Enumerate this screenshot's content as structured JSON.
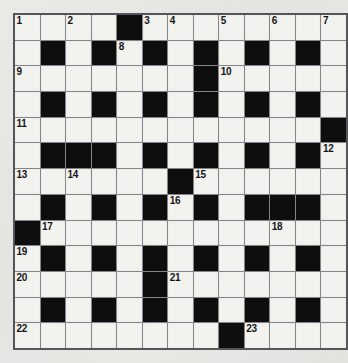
{
  "puzzle": {
    "title": "Crossword Grid",
    "rows": 13,
    "columns": 13,
    "colors": {
      "page_background": "#e9e9e7",
      "white_cell": "#f2f2ef",
      "black_cell": "#0e0e0e",
      "grid_line": "#84848a",
      "grid_border": "#55555a",
      "number_text": "#16161a"
    },
    "clue_numbers": [
      1,
      2,
      3,
      4,
      5,
      6,
      7,
      8,
      9,
      10,
      11,
      12,
      13,
      14,
      15,
      16,
      17,
      18,
      19,
      20,
      21,
      22,
      23
    ],
    "cells": [
      [
        {
          "type": "white",
          "number": "1",
          "letter": ""
        },
        {
          "type": "white",
          "number": "",
          "letter": ""
        },
        {
          "type": "white",
          "number": "2",
          "letter": ""
        },
        {
          "type": "white",
          "number": "",
          "letter": ""
        },
        {
          "type": "black",
          "number": "",
          "letter": ""
        },
        {
          "type": "white",
          "number": "3",
          "letter": ""
        },
        {
          "type": "white",
          "number": "4",
          "letter": ""
        },
        {
          "type": "white",
          "number": "",
          "letter": ""
        },
        {
          "type": "white",
          "number": "5",
          "letter": ""
        },
        {
          "type": "white",
          "number": "",
          "letter": ""
        },
        {
          "type": "white",
          "number": "6",
          "letter": ""
        },
        {
          "type": "white",
          "number": "",
          "letter": ""
        },
        {
          "type": "white",
          "number": "7",
          "letter": ""
        }
      ],
      [
        {
          "type": "white",
          "number": "",
          "letter": ""
        },
        {
          "type": "black",
          "number": "",
          "letter": ""
        },
        {
          "type": "white",
          "number": "",
          "letter": ""
        },
        {
          "type": "black",
          "number": "",
          "letter": ""
        },
        {
          "type": "white",
          "number": "8",
          "letter": ""
        },
        {
          "type": "black",
          "number": "",
          "letter": ""
        },
        {
          "type": "white",
          "number": "",
          "letter": ""
        },
        {
          "type": "black",
          "number": "",
          "letter": ""
        },
        {
          "type": "white",
          "number": "",
          "letter": ""
        },
        {
          "type": "black",
          "number": "",
          "letter": ""
        },
        {
          "type": "white",
          "number": "",
          "letter": ""
        },
        {
          "type": "black",
          "number": "",
          "letter": ""
        },
        {
          "type": "white",
          "number": "",
          "letter": ""
        }
      ],
      [
        {
          "type": "white",
          "number": "9",
          "letter": ""
        },
        {
          "type": "white",
          "number": "",
          "letter": ""
        },
        {
          "type": "white",
          "number": "",
          "letter": ""
        },
        {
          "type": "white",
          "number": "",
          "letter": ""
        },
        {
          "type": "white",
          "number": "",
          "letter": ""
        },
        {
          "type": "white",
          "number": "",
          "letter": ""
        },
        {
          "type": "white",
          "number": "",
          "letter": ""
        },
        {
          "type": "black",
          "number": "",
          "letter": ""
        },
        {
          "type": "white",
          "number": "10",
          "letter": ""
        },
        {
          "type": "white",
          "number": "",
          "letter": ""
        },
        {
          "type": "white",
          "number": "",
          "letter": ""
        },
        {
          "type": "white",
          "number": "",
          "letter": ""
        },
        {
          "type": "white",
          "number": "",
          "letter": ""
        }
      ],
      [
        {
          "type": "white",
          "number": "",
          "letter": ""
        },
        {
          "type": "black",
          "number": "",
          "letter": ""
        },
        {
          "type": "white",
          "number": "",
          "letter": ""
        },
        {
          "type": "black",
          "number": "",
          "letter": ""
        },
        {
          "type": "white",
          "number": "",
          "letter": ""
        },
        {
          "type": "black",
          "number": "",
          "letter": ""
        },
        {
          "type": "white",
          "number": "",
          "letter": ""
        },
        {
          "type": "black",
          "number": "",
          "letter": ""
        },
        {
          "type": "white",
          "number": "",
          "letter": ""
        },
        {
          "type": "black",
          "number": "",
          "letter": ""
        },
        {
          "type": "white",
          "number": "",
          "letter": ""
        },
        {
          "type": "black",
          "number": "",
          "letter": ""
        },
        {
          "type": "white",
          "number": "",
          "letter": ""
        }
      ],
      [
        {
          "type": "white",
          "number": "11",
          "letter": ""
        },
        {
          "type": "white",
          "number": "",
          "letter": ""
        },
        {
          "type": "white",
          "number": "",
          "letter": ""
        },
        {
          "type": "white",
          "number": "",
          "letter": ""
        },
        {
          "type": "white",
          "number": "",
          "letter": ""
        },
        {
          "type": "white",
          "number": "",
          "letter": ""
        },
        {
          "type": "white",
          "number": "",
          "letter": ""
        },
        {
          "type": "white",
          "number": "",
          "letter": ""
        },
        {
          "type": "white",
          "number": "",
          "letter": ""
        },
        {
          "type": "white",
          "number": "",
          "letter": ""
        },
        {
          "type": "white",
          "number": "",
          "letter": ""
        },
        {
          "type": "white",
          "number": "",
          "letter": ""
        },
        {
          "type": "black",
          "number": "",
          "letter": ""
        }
      ],
      [
        {
          "type": "white",
          "number": "",
          "letter": ""
        },
        {
          "type": "black",
          "number": "",
          "letter": ""
        },
        {
          "type": "black",
          "number": "",
          "letter": ""
        },
        {
          "type": "black",
          "number": "",
          "letter": ""
        },
        {
          "type": "white",
          "number": "",
          "letter": ""
        },
        {
          "type": "black",
          "number": "",
          "letter": ""
        },
        {
          "type": "white",
          "number": "",
          "letter": ""
        },
        {
          "type": "black",
          "number": "",
          "letter": ""
        },
        {
          "type": "white",
          "number": "",
          "letter": ""
        },
        {
          "type": "black",
          "number": "",
          "letter": ""
        },
        {
          "type": "white",
          "number": "",
          "letter": ""
        },
        {
          "type": "black",
          "number": "",
          "letter": ""
        },
        {
          "type": "white",
          "number": "12",
          "letter": ""
        }
      ],
      [
        {
          "type": "white",
          "number": "13",
          "letter": ""
        },
        {
          "type": "white",
          "number": "",
          "letter": ""
        },
        {
          "type": "white",
          "number": "14",
          "letter": ""
        },
        {
          "type": "white",
          "number": "",
          "letter": ""
        },
        {
          "type": "white",
          "number": "",
          "letter": ""
        },
        {
          "type": "white",
          "number": "",
          "letter": ""
        },
        {
          "type": "black",
          "number": "",
          "letter": ""
        },
        {
          "type": "white",
          "number": "15",
          "letter": ""
        },
        {
          "type": "white",
          "number": "",
          "letter": ""
        },
        {
          "type": "white",
          "number": "",
          "letter": ""
        },
        {
          "type": "white",
          "number": "",
          "letter": ""
        },
        {
          "type": "white",
          "number": "",
          "letter": ""
        },
        {
          "type": "white",
          "number": "",
          "letter": ""
        }
      ],
      [
        {
          "type": "white",
          "number": "",
          "letter": ""
        },
        {
          "type": "black",
          "number": "",
          "letter": ""
        },
        {
          "type": "white",
          "number": "",
          "letter": ""
        },
        {
          "type": "black",
          "number": "",
          "letter": ""
        },
        {
          "type": "white",
          "number": "",
          "letter": ""
        },
        {
          "type": "black",
          "number": "",
          "letter": ""
        },
        {
          "type": "white",
          "number": "16",
          "letter": ""
        },
        {
          "type": "black",
          "number": "",
          "letter": ""
        },
        {
          "type": "white",
          "number": "",
          "letter": ""
        },
        {
          "type": "black",
          "number": "",
          "letter": ""
        },
        {
          "type": "black",
          "number": "",
          "letter": ""
        },
        {
          "type": "black",
          "number": "",
          "letter": ""
        },
        {
          "type": "white",
          "number": "",
          "letter": ""
        }
      ],
      [
        {
          "type": "black",
          "number": "",
          "letter": ""
        },
        {
          "type": "white",
          "number": "17",
          "letter": ""
        },
        {
          "type": "white",
          "number": "",
          "letter": ""
        },
        {
          "type": "white",
          "number": "",
          "letter": ""
        },
        {
          "type": "white",
          "number": "",
          "letter": ""
        },
        {
          "type": "white",
          "number": "",
          "letter": ""
        },
        {
          "type": "white",
          "number": "",
          "letter": ""
        },
        {
          "type": "white",
          "number": "",
          "letter": ""
        },
        {
          "type": "white",
          "number": "",
          "letter": ""
        },
        {
          "type": "white",
          "number": "",
          "letter": ""
        },
        {
          "type": "white",
          "number": "18",
          "letter": ""
        },
        {
          "type": "white",
          "number": "",
          "letter": ""
        },
        {
          "type": "white",
          "number": "",
          "letter": ""
        }
      ],
      [
        {
          "type": "white",
          "number": "19",
          "letter": ""
        },
        {
          "type": "black",
          "number": "",
          "letter": ""
        },
        {
          "type": "white",
          "number": "",
          "letter": ""
        },
        {
          "type": "black",
          "number": "",
          "letter": ""
        },
        {
          "type": "white",
          "number": "",
          "letter": ""
        },
        {
          "type": "black",
          "number": "",
          "letter": ""
        },
        {
          "type": "white",
          "number": "",
          "letter": ""
        },
        {
          "type": "black",
          "number": "",
          "letter": ""
        },
        {
          "type": "white",
          "number": "",
          "letter": ""
        },
        {
          "type": "black",
          "number": "",
          "letter": ""
        },
        {
          "type": "white",
          "number": "",
          "letter": ""
        },
        {
          "type": "black",
          "number": "",
          "letter": ""
        },
        {
          "type": "white",
          "number": "",
          "letter": ""
        }
      ],
      [
        {
          "type": "white",
          "number": "20",
          "letter": ""
        },
        {
          "type": "white",
          "number": "",
          "letter": ""
        },
        {
          "type": "white",
          "number": "",
          "letter": ""
        },
        {
          "type": "white",
          "number": "",
          "letter": ""
        },
        {
          "type": "white",
          "number": "",
          "letter": ""
        },
        {
          "type": "black",
          "number": "",
          "letter": ""
        },
        {
          "type": "white",
          "number": "21",
          "letter": ""
        },
        {
          "type": "white",
          "number": "",
          "letter": ""
        },
        {
          "type": "white",
          "number": "",
          "letter": ""
        },
        {
          "type": "white",
          "number": "",
          "letter": ""
        },
        {
          "type": "white",
          "number": "",
          "letter": ""
        },
        {
          "type": "white",
          "number": "",
          "letter": ""
        },
        {
          "type": "white",
          "number": "",
          "letter": ""
        }
      ],
      [
        {
          "type": "white",
          "number": "",
          "letter": ""
        },
        {
          "type": "black",
          "number": "",
          "letter": ""
        },
        {
          "type": "white",
          "number": "",
          "letter": ""
        },
        {
          "type": "black",
          "number": "",
          "letter": ""
        },
        {
          "type": "white",
          "number": "",
          "letter": ""
        },
        {
          "type": "black",
          "number": "",
          "letter": ""
        },
        {
          "type": "white",
          "number": "",
          "letter": ""
        },
        {
          "type": "black",
          "number": "",
          "letter": ""
        },
        {
          "type": "white",
          "number": "",
          "letter": ""
        },
        {
          "type": "black",
          "number": "",
          "letter": ""
        },
        {
          "type": "white",
          "number": "",
          "letter": ""
        },
        {
          "type": "black",
          "number": "",
          "letter": ""
        },
        {
          "type": "white",
          "number": "",
          "letter": ""
        }
      ],
      [
        {
          "type": "white",
          "number": "22",
          "letter": ""
        },
        {
          "type": "white",
          "number": "",
          "letter": ""
        },
        {
          "type": "white",
          "number": "",
          "letter": ""
        },
        {
          "type": "white",
          "number": "",
          "letter": ""
        },
        {
          "type": "white",
          "number": "",
          "letter": ""
        },
        {
          "type": "white",
          "number": "",
          "letter": ""
        },
        {
          "type": "white",
          "number": "",
          "letter": ""
        },
        {
          "type": "white",
          "number": "",
          "letter": ""
        },
        {
          "type": "black",
          "number": "",
          "letter": ""
        },
        {
          "type": "white",
          "number": "23",
          "letter": ""
        },
        {
          "type": "white",
          "number": "",
          "letter": ""
        },
        {
          "type": "white",
          "number": "",
          "letter": ""
        },
        {
          "type": "white",
          "number": "",
          "letter": ""
        }
      ]
    ]
  }
}
